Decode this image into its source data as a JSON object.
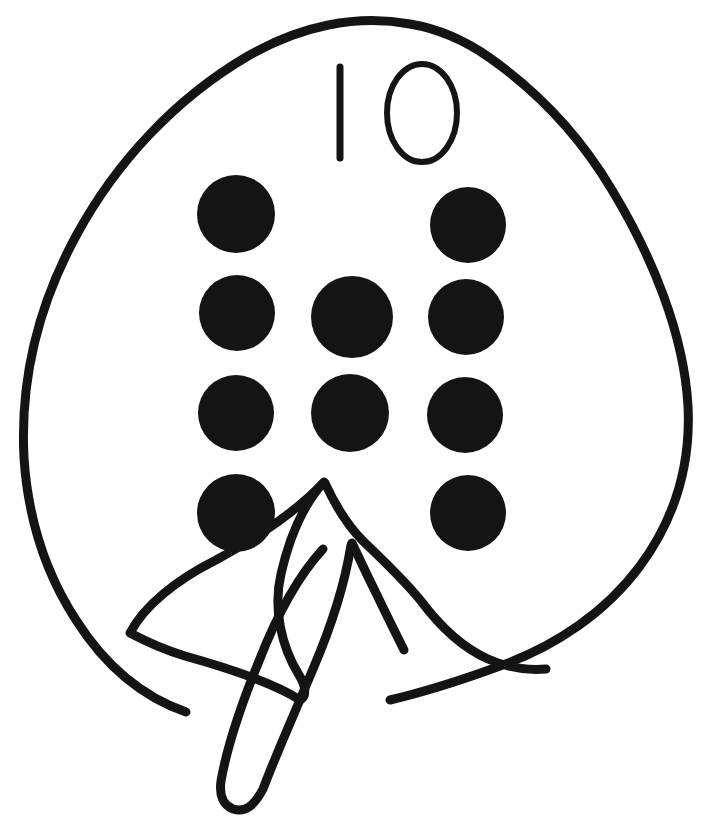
{
  "page": {
    "title": "Leaf counting worksheet",
    "width": 704,
    "height": 825,
    "background_color": "#ffffff",
    "ink_color": "#141414",
    "style": "hand-drawn black line art, uncolored"
  },
  "number_label": {
    "name": "handwritten-number",
    "value": "10",
    "digits": [
      {
        "glyph": "1",
        "form": "vertical-stroke",
        "x": 340,
        "y_top": 67,
        "y_bottom": 158
      },
      {
        "glyph": "0",
        "form": "oval-outline",
        "cx": 422,
        "cy": 113,
        "rx": 35,
        "ry": 49
      }
    ],
    "stroke_width": 6
  },
  "counting_dots": {
    "name": "counting-dots",
    "total": 10,
    "color": "#141414",
    "rows": [
      {
        "row_index": 1,
        "count": 2,
        "dots": [
          {
            "cx": 236,
            "cy": 214,
            "r": 39
          },
          {
            "cx": 468,
            "cy": 225,
            "r": 38
          }
        ]
      },
      {
        "row_index": 2,
        "count": 3,
        "dots": [
          {
            "cx": 237,
            "cy": 313,
            "r": 38
          },
          {
            "cx": 352,
            "cy": 317,
            "r": 41
          },
          {
            "cx": 466,
            "cy": 317,
            "r": 38
          }
        ]
      },
      {
        "row_index": 3,
        "count": 3,
        "dots": [
          {
            "cx": 236,
            "cy": 413,
            "r": 38
          },
          {
            "cx": 350,
            "cy": 413,
            "r": 39
          },
          {
            "cx": 465,
            "cy": 415,
            "r": 38
          }
        ]
      },
      {
        "row_index": 4,
        "count": 2,
        "dots": [
          {
            "cx": 236,
            "cy": 513,
            "r": 39
          },
          {
            "cx": 468,
            "cy": 513,
            "r": 38
          }
        ]
      }
    ]
  },
  "leaf_outline": {
    "name": "leaf-blade-outline",
    "stroke_width": 9,
    "path": "M 322 486 C 356 470 386 452 404 418 C 420 388 418 352 400 318"
  },
  "shapes": {
    "blade": {
      "name": "leaf-blade",
      "stroke_width": 9,
      "path": "M 325 485 C 300 510 262 536 215 560 C 174 580 142 605 128 634 C 143 643 160 650 180 655 C 226 666 272 681 300 700 C 305 697 304 688 298 678 C 281 648 272 610 280 576 C 287 541 302 508 325 485 Z"
    },
    "outer": {
      "name": "leaf-outer-contour",
      "stroke_width": 9,
      "path": "M 186 710 C 128 690 90 650 62 600 C 34 548 22 492 24 434 C 26 352 52 268 100 196 C 148 124 214 64 290 34 C 352 10 412 14 468 40 C 532 70 588 120 628 184 C 668 250 692 330 688 404 C 684 470 662 528 622 576 C 584 622 530 654 470 672 C 438 682 410 690 386 698"
    },
    "stem_left": {
      "name": "stem-left-blade",
      "stroke_width": 9,
      "path": "M 325 483 C 300 509 262 536 216 561 C 176 581 144 606 130 634 C 146 642 164 650 184 656 C 228 668 272 682 300 700 C 306 697 305 687 298 676 C 280 647 272 609 280 575 C 288 540 302 507 325 483 Z"
    },
    "stem_right": {
      "name": "stem-right-vein",
      "stroke_width": 9,
      "path": "M 326 483 C 338 508 352 528 368 543 C 388 562 408 581 424 602 C 442 626 464 648 492 660 C 510 668 528 672 548 670"
    },
    "stem_lower": {
      "name": "stem-lower-shaft",
      "stroke_width": 9,
      "path": "M 350 545 C 344 582 330 626 312 668 C 294 710 276 752 262 790 C 252 808 244 814 232 810 C 222 806 218 796 220 782 C 226 748 240 706 258 662 C 276 616 298 576 322 550"
    }
  },
  "semantics": {
    "subject": "leaf",
    "activity": "count-the-dots",
    "dot_count_label": "10",
    "filled_dot_count": 10
  }
}
